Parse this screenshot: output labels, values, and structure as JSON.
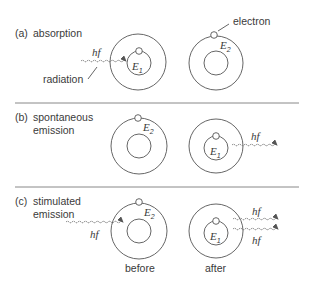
{
  "figure": {
    "sections": [
      {
        "id": "a",
        "tag": "(a)",
        "title_lines": [
          "absorption"
        ],
        "photon_label": "hf",
        "annotations": {
          "radiation": "radiation",
          "electron": "electron"
        },
        "left_level": {
          "letter": "E",
          "sub": "1"
        },
        "right_level": {
          "letter": "E",
          "sub": "2"
        }
      },
      {
        "id": "b",
        "tag": "(b)",
        "title_lines": [
          "spontaneous",
          "emission"
        ],
        "photon_label": "hf",
        "left_level": {
          "letter": "E",
          "sub": "2"
        },
        "right_level": {
          "letter": "E",
          "sub": "1"
        }
      },
      {
        "id": "c",
        "tag": "(c)",
        "title_lines": [
          "stimulated",
          "emission"
        ],
        "photon_label": "hf",
        "out_labels": [
          "hf",
          "hf"
        ],
        "left_level": {
          "letter": "E",
          "sub": "2"
        },
        "right_level": {
          "letter": "E",
          "sub": "1"
        },
        "captions": {
          "before": "before",
          "after": "after"
        }
      }
    ],
    "colors": {
      "line": "#555555",
      "text": "#3a3a3a",
      "rule": "#888888"
    }
  }
}
